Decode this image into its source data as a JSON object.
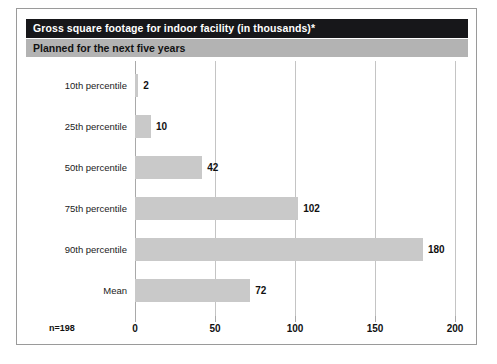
{
  "figure": {
    "title": "Gross square footage for indoor facility (in thousands)*",
    "subtitle": "Planned for the next five years",
    "sample_note": "n=198",
    "title_bar_color": "#17171a",
    "title_text_color": "#ffffff",
    "subtitle_bar_color": "#b3b3b3",
    "bar_color": "#c9c9c9",
    "gridline_color": "#c4c4c4",
    "border_color": "#9a9a9a"
  },
  "chart_data": {
    "type": "bar",
    "orientation": "horizontal",
    "title": "Gross square footage for indoor facility (in thousands)*",
    "subtitle": "Planned for the next five years",
    "categories": [
      "10th percentile",
      "25th percentile",
      "50th percentile",
      "75th percentile",
      "90th percentile",
      "Mean"
    ],
    "values": [
      2,
      10,
      42,
      102,
      180,
      72
    ],
    "xlabel": "",
    "ylabel": "",
    "xlim": [
      0,
      200
    ],
    "xticks": [
      0,
      50,
      100,
      150,
      200
    ],
    "xtick_labels": [
      "0",
      "50",
      "100",
      "150",
      "200"
    ],
    "data_labels": [
      "2",
      "10",
      "42",
      "102",
      "180",
      "72"
    ],
    "grid": true,
    "grid_axis": "x",
    "legend": false,
    "annotations": [
      "n=198"
    ]
  }
}
